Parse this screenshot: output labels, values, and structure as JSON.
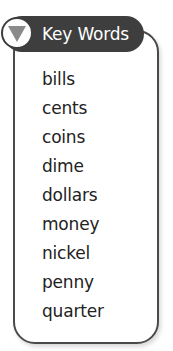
{
  "header": {
    "title": "Key Words",
    "icon": "triangle-down-icon",
    "colors": {
      "header_bg": "#3e3e3e",
      "header_text": "#ffffff",
      "triangle": "#8a8a8a",
      "border": "#4a4a4a"
    }
  },
  "words": [
    "bills",
    "cents",
    "coins",
    "dime",
    "dollars",
    "money",
    "nickel",
    "penny",
    "quarter"
  ]
}
